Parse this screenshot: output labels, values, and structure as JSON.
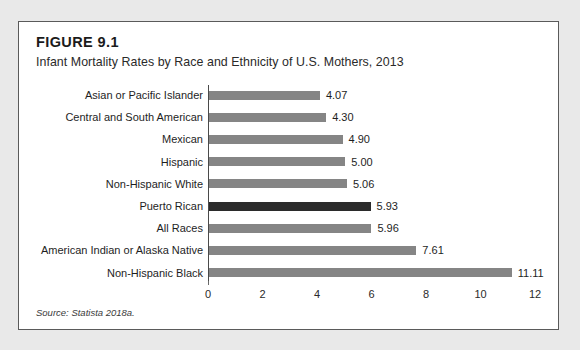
{
  "figure": {
    "number": "FIGURE 9.1",
    "title": "Infant Mortality Rates by Race and Ethnicity of U.S. Mothers, 2013",
    "source": "Source: Statista 2018a."
  },
  "colors": {
    "page_background": "#e9e9e9",
    "box_background": "#ffffff",
    "box_border": "#5a5a5a",
    "bar": "#858585",
    "bar_highlight": "#2b2b2b",
    "axis": "#4a4a4a",
    "text": "#1e1e1e"
  },
  "chart_data": {
    "type": "bar",
    "orientation": "horizontal",
    "title": "Infant Mortality Rates by Race and Ethnicity of U.S. Mothers, 2013",
    "xlabel": "",
    "ylabel": "",
    "xlim": [
      0,
      12
    ],
    "xticks": [
      "0",
      "2",
      "4",
      "6",
      "8",
      "10",
      "12"
    ],
    "xtick_values": [
      0,
      2,
      4,
      6,
      8,
      10,
      12
    ],
    "grid": false,
    "legend": "none",
    "categories": [
      "Asian or Pacific Islander",
      "Central and South American",
      "Mexican",
      "Hispanic",
      "Non-Hispanic White",
      "Puerto Rican",
      "All Races",
      "American Indian or Alaska Native",
      "Non-Hispanic Black"
    ],
    "values": [
      4.07,
      4.3,
      4.9,
      5.0,
      5.06,
      5.93,
      5.96,
      7.61,
      11.11
    ],
    "value_labels": [
      "4.07",
      "4.30",
      "4.90",
      "5.00",
      "5.06",
      "5.93",
      "5.96",
      "7.61",
      "11.11"
    ],
    "highlight_index": 5,
    "source": "Source: Statista 2018a."
  }
}
